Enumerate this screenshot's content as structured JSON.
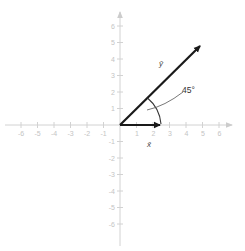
{
  "diagram": {
    "title": "",
    "origin_px": [
      120,
      125
    ],
    "unit_px": 16.5,
    "axes": {
      "color": "#d0d0d0",
      "x_range": [
        -6,
        6
      ],
      "y_range": [
        -6,
        6
      ],
      "x_ticks": [
        "-6",
        "-5",
        "-4",
        "-3",
        "-2",
        "-1",
        "1",
        "2",
        "3",
        "4",
        "5",
        "6"
      ],
      "y_ticks_positive": [
        "1",
        "2",
        "3",
        "4",
        "5",
        "6"
      ],
      "y_ticks_negative": [
        "-1",
        "-2",
        "-3",
        "-4",
        "-5",
        "-6"
      ]
    },
    "vectors": [
      {
        "id": "x",
        "label": "x̄",
        "from": [
          0,
          0
        ],
        "to": [
          2.5,
          0
        ],
        "color": "#1a1a1a"
      },
      {
        "id": "y",
        "label": "ȳ",
        "from": [
          0,
          0
        ],
        "to": [
          5.3,
          5.3
        ],
        "color": "#1a1a1a"
      }
    ],
    "angle": {
      "label": "45°",
      "degrees": 45,
      "between": [
        "x",
        "y"
      ],
      "color": "#333333"
    }
  }
}
